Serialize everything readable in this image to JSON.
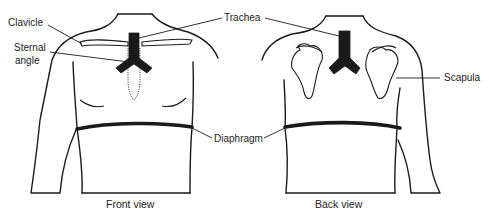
{
  "figure": {
    "labels": {
      "clavicle": "Clavicle",
      "trachea": "Trachea",
      "sternal_angle_line1": "Sternal",
      "sternal_angle_line2": "angle",
      "scapula": "Scapula",
      "diaphragm": "Diaphragm"
    },
    "views": [
      {
        "caption": "Front view"
      },
      {
        "caption": "Back view"
      }
    ],
    "colors": {
      "ink": "#1a1a1a",
      "background": "#ffffff"
    }
  }
}
